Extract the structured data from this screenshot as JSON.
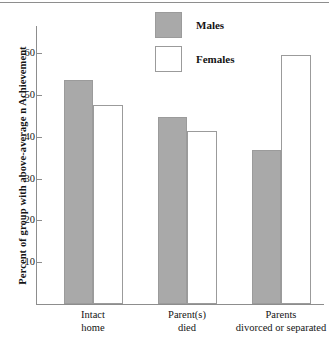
{
  "chart_data": {
    "type": "bar",
    "title": "",
    "xlabel": "",
    "ylabel": "Percent of group with above-average n Achievement",
    "categories": [
      "Intact home",
      "Parent(s) died",
      "Parents divorced or separated"
    ],
    "category_lines": [
      [
        "Intact",
        "home"
      ],
      [
        "Parent(s)",
        "died"
      ],
      [
        "Parents",
        "divorced or separated"
      ]
    ],
    "series": [
      {
        "name": "Males",
        "color": "#a9a9a9",
        "values": [
          53.5,
          44.8,
          36.9
        ]
      },
      {
        "name": "Females",
        "color": "#ffffff",
        "values": [
          47.6,
          41.3,
          59.5
        ]
      }
    ],
    "ylim": [
      0,
      65
    ],
    "yticks": [
      10,
      20,
      30,
      40,
      50,
      60
    ],
    "ytick_labels": [
      "10",
      "20",
      "30",
      "40",
      "50",
      "60"
    ],
    "grid": false,
    "legend_position": "top-center"
  },
  "legend": {
    "items": [
      {
        "label": "Males",
        "swatch": "filled-gray-square"
      },
      {
        "label": "Females",
        "swatch": "outlined-white-square"
      }
    ]
  },
  "colors": {
    "male_fill": "#a9a9a9",
    "female_fill": "#ffffff",
    "bar_stroke": "#9b9b9b",
    "axis": "#8d8d8d",
    "text": "#141414",
    "background": "#ffffff"
  }
}
